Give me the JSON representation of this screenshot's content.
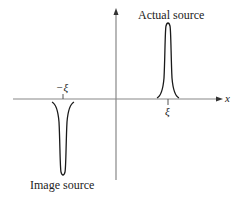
{
  "diagram": {
    "labels": {
      "actual_source": "Actual source",
      "image_source": "Image source",
      "x_axis": "x",
      "tick_pos": "ξ",
      "tick_neg": "−ξ"
    },
    "colors": {
      "curve": "#1a1a1a",
      "axis": "#888888",
      "text": "#222222"
    },
    "elements": [
      {
        "type": "axis",
        "name": "x-axis",
        "direction": "horizontal",
        "arrow": true
      },
      {
        "type": "axis",
        "name": "vertical-axis",
        "direction": "vertical",
        "arrow": true
      },
      {
        "type": "peak",
        "name": "actual-source",
        "position": "ξ",
        "sign": "positive"
      },
      {
        "type": "peak",
        "name": "image-source",
        "position": "−ξ",
        "sign": "negative"
      }
    ]
  }
}
